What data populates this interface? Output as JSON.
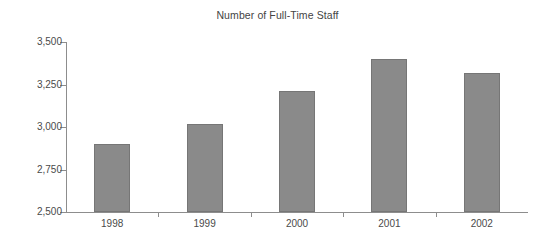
{
  "chart_data": {
    "type": "bar",
    "title": "Number of Full-Time Staff",
    "xlabel": "",
    "ylabel": "",
    "categories": [
      "1998",
      "1999",
      "2000",
      "2001",
      "2002"
    ],
    "values": [
      2900,
      3020,
      3210,
      3400,
      3320
    ],
    "ylim": [
      2500,
      3500
    ],
    "ytick_values": [
      2500,
      2750,
      3000,
      3250,
      3500
    ],
    "ytick_labels": [
      "2,500",
      "2,750",
      "3,000",
      "3,250",
      "3,500"
    ],
    "grid": false,
    "legend": null,
    "series": [
      {
        "name": "Full-Time Staff",
        "values": [
          2900,
          3020,
          3210,
          3400,
          3320
        ]
      }
    ],
    "colors": {
      "bar_fill": "#8a8a8a",
      "bar_edge": "#767676",
      "axis": "#8d8d8d",
      "text": "#4a4a4a",
      "background": "#ffffff"
    }
  }
}
